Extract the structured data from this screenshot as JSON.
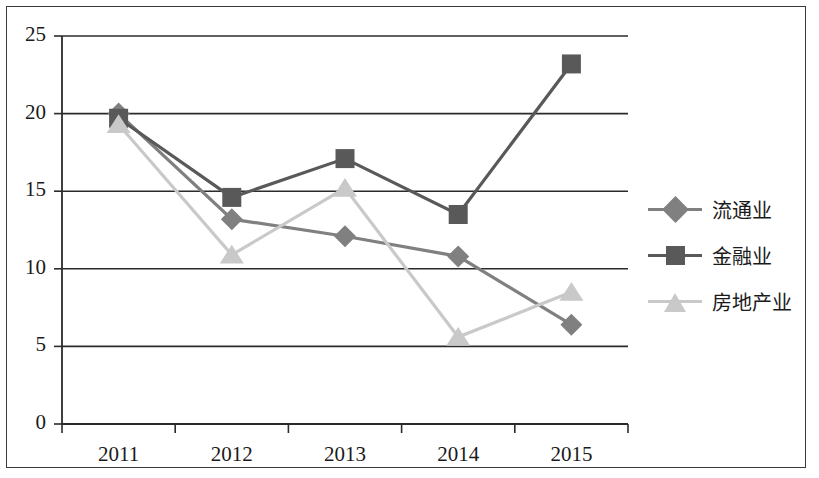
{
  "chart_data": {
    "type": "line",
    "title": "",
    "subtitle": "",
    "xlabel": "",
    "ylabel": "",
    "categories": [
      "2011",
      "2012",
      "2013",
      "2014",
      "2015"
    ],
    "ylim": [
      0,
      25
    ],
    "y_ticks": [
      "0",
      "5",
      "10",
      "15",
      "20",
      "25"
    ],
    "grid": "horizontal",
    "legend_position": "right",
    "series": [
      {
        "name": "流通业",
        "marker": "diamond",
        "color": "#808080",
        "values": [
          20.0,
          13.2,
          12.1,
          10.8,
          6.4
        ]
      },
      {
        "name": "金融业",
        "marker": "square",
        "color": "#595959",
        "values": [
          19.7,
          14.6,
          17.1,
          13.5,
          23.2
        ]
      },
      {
        "name": "房地产业",
        "marker": "triangle",
        "color": "#c9c9c9",
        "values": [
          19.3,
          10.9,
          15.2,
          5.6,
          8.5
        ]
      }
    ]
  },
  "axes": {
    "axis_color": "#2b2b2b",
    "grid_color": "#2b2b2b"
  },
  "frame": {
    "border_color": "#3a3a3a"
  }
}
